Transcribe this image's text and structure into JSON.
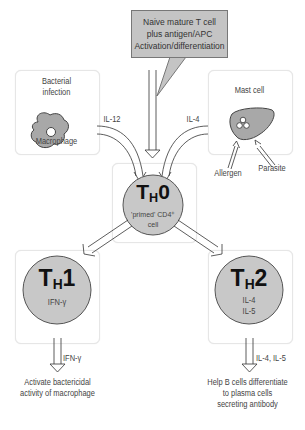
{
  "callout": {
    "lines": [
      "Naive mature T cell",
      "plus antigen/APC",
      "Activation/differentiation"
    ]
  },
  "left_panel": {
    "title_lines": [
      "Bacterial",
      "infection"
    ],
    "cell_label": "Macrophage"
  },
  "right_panel": {
    "title": "Mast cell",
    "inputs": [
      "Allergen",
      "Parasite"
    ]
  },
  "cytokine_inputs": {
    "left": "IL-12",
    "right": "IL-4"
  },
  "th0": {
    "main": "T",
    "sub": "H",
    "num": "0",
    "desc_lines": [
      "'primed' CD4⁺",
      "cell"
    ]
  },
  "th1": {
    "main": "T",
    "sub": "H",
    "num": "1",
    "cytokines": [
      "IFN-γ"
    ],
    "output_cytokine": "IFN-γ",
    "outcome_lines": [
      "Activate bactericidal",
      "activity of macrophage"
    ]
  },
  "th2": {
    "main": "T",
    "sub": "H",
    "num": "2",
    "cytokines": [
      "IL-4",
      "IL-5"
    ],
    "output_cytokine": "IL-4, IL-5",
    "outcome_lines": [
      "Help B cells differentiate",
      "to plasma cells",
      "secreting antibody"
    ]
  },
  "colors": {
    "cell_fill": "#c8c8c8",
    "panel_border": "#e6e6e6",
    "callout_fill": "#c4c4c4",
    "line": "#333333"
  }
}
